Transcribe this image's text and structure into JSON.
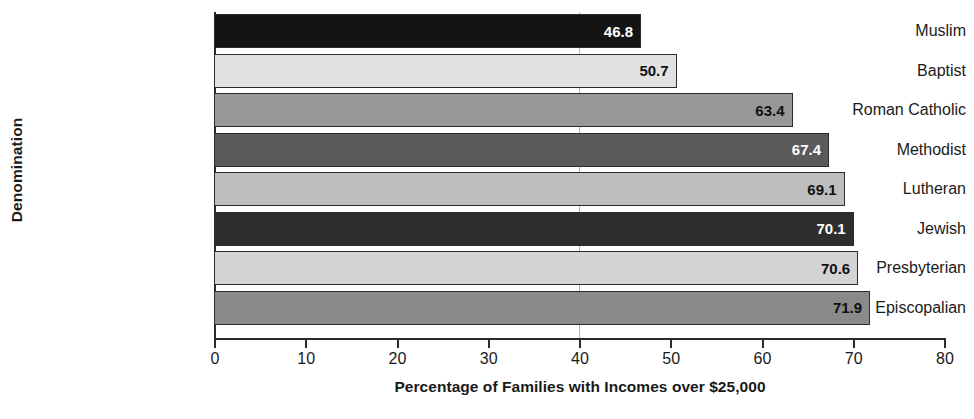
{
  "chart_data": {
    "type": "bar",
    "orientation": "horizontal",
    "title": "",
    "xlabel": "Percentage of Families with Incomes over $25,000",
    "ylabel": "Denomination",
    "categories": [
      "Muslim",
      "Baptist",
      "Roman Catholic",
      "Methodist",
      "Lutheran",
      "Jewish",
      "Presbyterian",
      "Episcopalian"
    ],
    "values": [
      46.8,
      50.7,
      63.4,
      67.4,
      69.1,
      70.1,
      70.6,
      71.9
    ],
    "value_labels": [
      "46.8",
      "50.7",
      "63.4",
      "67.4",
      "69.1",
      "70.1",
      "70.6",
      "71.9"
    ],
    "bar_colors": [
      "#141414",
      "#e2e2e2",
      "#989898",
      "#5a5a5a",
      "#bebebe",
      "#2e2e2e",
      "#d4d4d4",
      "#8a8a8a"
    ],
    "label_colors": [
      "#ffffff",
      "#101010",
      "#101010",
      "#ffffff",
      "#101010",
      "#ffffff",
      "#101010",
      "#101010"
    ],
    "bar_outline_color": "#2b2b2b",
    "axis_color": "#2b2b2b",
    "background_color": "#ffffff",
    "xlim": [
      0,
      80
    ],
    "xticks": [
      0,
      10,
      20,
      30,
      40,
      50,
      60,
      70,
      80
    ],
    "xtick_labels": [
      "0",
      "10",
      "20",
      "30",
      "40",
      "50",
      "60",
      "70",
      "80"
    ],
    "gridlines": [
      40
    ],
    "grid": false,
    "legend": null
  }
}
